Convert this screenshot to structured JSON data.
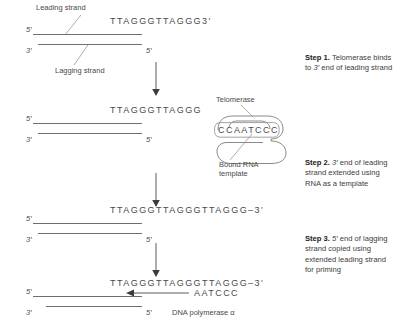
{
  "diagram": {
    "accent_color": "#4a4a4a",
    "line_color": "#6f6f6f"
  },
  "panels": [
    {
      "id": "panel-1",
      "labels": {
        "leading_strand": "Leading strand",
        "lagging_strand": "Lagging strand"
      },
      "primes": {
        "top_left": "5′",
        "bottom_left": "3′",
        "bottom_right": "5′"
      },
      "sequence_top": "TTAGGGTTAGGG3′"
    },
    {
      "id": "panel-2",
      "primes": {
        "top_left": "5′",
        "bottom_left": "3′",
        "bottom_right": "5′"
      },
      "sequence_top": "TTAGGGTTAGGG",
      "sequence_rna": "CCAATCCC",
      "labels": {
        "telomerase": "Telomerase",
        "bound_rna_template": "Bound RNA\ntemplate",
        "bound_rna_template_line1": "Bound RNA",
        "bound_rna_template_line2": "template"
      }
    },
    {
      "id": "panel-3",
      "primes": {
        "top_left": "5′",
        "bottom_left": "3′",
        "bottom_right": "5′"
      },
      "sequence_top": "TTAGGGTTAGGGTTAGGG–3′"
    },
    {
      "id": "panel-4",
      "primes": {
        "top_left": "5′",
        "bottom_left": "3′",
        "bottom_right": "5′"
      },
      "sequence_top": "TTAGGGTTAGGGTTAGGG–3′",
      "sequence_primer": "AATCCC",
      "labels": {
        "dna_polymerase": "DNA polymerase α"
      }
    }
  ],
  "steps": [
    {
      "id": "step-1",
      "number": "Step 1.",
      "text": " Telomerase binds to 3′ end of leading strand",
      "body_before_italic": " Telomerase binds to ",
      "italic": "3′",
      "body_after_italic": " end of leading strand"
    },
    {
      "id": "step-2",
      "number": "Step 2.",
      "text": " 3′ end of leading strand extended using RNA as a template",
      "body_before_italic": " ",
      "italic": "3′",
      "body_after_italic": " end of leading strand extended using RNA as a template"
    },
    {
      "id": "step-3",
      "number": "Step 3.",
      "text": " 5′ end of lagging strand copied using extended leading strand for priming",
      "body_before_italic": " ",
      "italic": "5′",
      "body_after_italic": " end of lagging strand copied using extended leading strand for priming"
    }
  ],
  "icons": {
    "flow_arrow": "down-arrow-icon",
    "polymerase_arrow": "left-arrow-icon",
    "telomerase_blob": "telomerase-enzyme-icon",
    "rna_template_box": "rna-template-box-icon"
  },
  "footer": {
    "cut_text": ""
  }
}
